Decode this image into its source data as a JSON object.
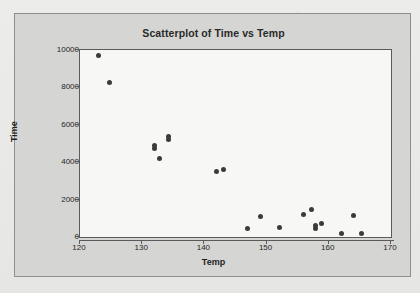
{
  "panel": {
    "background_color": "#d5d5d3",
    "border_color": "#8e8e8e"
  },
  "chart_data": {
    "type": "scatter",
    "title": "Scatterplot of Time vs Temp",
    "xlabel": "Temp",
    "ylabel": "Time",
    "xlim": [
      120,
      170
    ],
    "ylim": [
      0,
      10000
    ],
    "xticks": [
      120,
      130,
      140,
      150,
      160,
      170
    ],
    "yticks": [
      0,
      2000,
      4000,
      6000,
      8000,
      10000
    ],
    "xtick_labels": [
      "120",
      "130",
      "140",
      "150",
      "160",
      "170"
    ],
    "ytick_labels": [
      "0",
      "2000",
      "4000",
      "6000",
      "8000",
      "10000"
    ],
    "grid": false,
    "legend": null,
    "marker_color": "#3b3b3b",
    "marker_size": 5,
    "plot_background": "#f7f7f6",
    "points": [
      {
        "x": 123.0,
        "y": 9700
      },
      {
        "x": 124.8,
        "y": 8250
      },
      {
        "x": 132.0,
        "y": 4900
      },
      {
        "x": 132.0,
        "y": 4750
      },
      {
        "x": 132.8,
        "y": 4200
      },
      {
        "x": 134.2,
        "y": 5350
      },
      {
        "x": 134.2,
        "y": 5200
      },
      {
        "x": 142.0,
        "y": 3500
      },
      {
        "x": 143.0,
        "y": 3620
      },
      {
        "x": 147.0,
        "y": 480
      },
      {
        "x": 149.0,
        "y": 1120
      },
      {
        "x": 152.0,
        "y": 490
      },
      {
        "x": 156.0,
        "y": 1180
      },
      {
        "x": 157.2,
        "y": 1450
      },
      {
        "x": 157.8,
        "y": 600
      },
      {
        "x": 157.8,
        "y": 470
      },
      {
        "x": 158.8,
        "y": 740
      },
      {
        "x": 162.0,
        "y": 190
      },
      {
        "x": 164.0,
        "y": 1170
      },
      {
        "x": 165.2,
        "y": 190
      }
    ]
  }
}
